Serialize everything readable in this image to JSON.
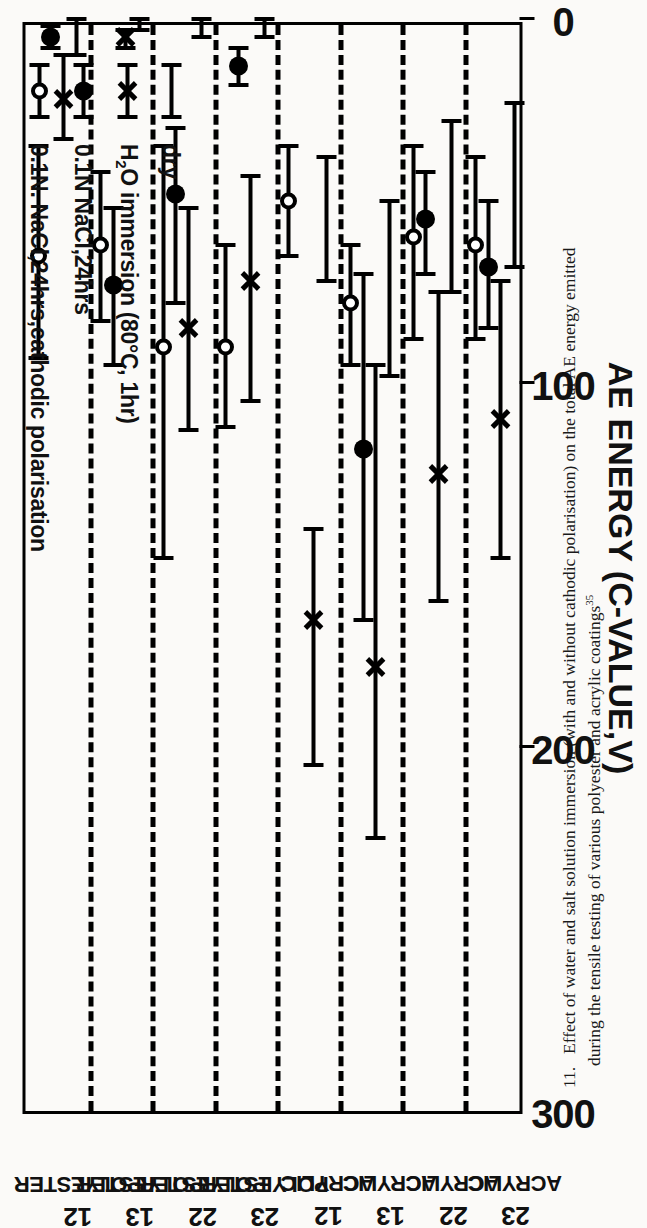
{
  "figure": {
    "caption_number": "11.",
    "caption_line1": "Effect of water and salt solution immersion (with and without cathodic polarisation) on the total AE energy emitted",
    "caption_line2": "during the tensile testing of various polyester and acrylic coatings",
    "caption_ref": "35"
  },
  "axis": {
    "title": "AE ENERGY (C-VALUE,V)",
    "ticks": [
      "0",
      "100",
      "200",
      "300"
    ],
    "min": 0,
    "max": 300
  },
  "legend": {
    "items": [
      {
        "symbol": "open-circle",
        "label": "0.1N. NaCl,24hrs,cathodic polarisation"
      },
      {
        "symbol": "filled-circle",
        "label": "0.1N NaCl,24hrs"
      },
      {
        "symbol": "cross",
        "label_pre": "H",
        "label_sub": "2",
        "label_post": "O immersion (80°C, 1hr)"
      },
      {
        "symbol": "plain-bar",
        "label": "dry"
      }
    ]
  },
  "chart_data": {
    "type": "scatter",
    "title": "",
    "xlabel": "",
    "ylabel": "AE ENERGY (C-VALUE,V)",
    "ylim": [
      0,
      300
    ],
    "grid": false,
    "legend_position": "inside-left",
    "orientation": "rotated-90-ccw",
    "categories": [
      {
        "material": "POLYESTER",
        "code": "12"
      },
      {
        "material": "POLYESTER",
        "code": "13"
      },
      {
        "material": "POLYESTER",
        "code": "22"
      },
      {
        "material": "POLYESTER",
        "code": "23"
      },
      {
        "material": "ACRYLIC",
        "code": "12"
      },
      {
        "material": "ACRYLIC",
        "code": "13"
      },
      {
        "material": "ACRYLIC",
        "code": "22"
      },
      {
        "material": "ACRYLIC",
        "code": "23"
      }
    ],
    "series": [
      {
        "name": "0.1N. NaCl,24hrs,cathodic polarisation",
        "marker": "open-circle",
        "values": [
          65,
          62,
          90,
          90,
          50,
          78,
          60,
          62
        ],
        "err_low": [
          35,
          42,
          35,
          62,
          35,
          62,
          35,
          38
        ],
        "err_high": [
          93,
          83,
          148,
          112,
          65,
          95,
          88,
          88
        ]
      },
      {
        "name": "0.1N NaCl,24hrs",
        "marker": "filled-circle",
        "values": [
          5,
          73,
          48,
          13,
          null,
          118,
          55,
          68
        ],
        "err_low": [
          2,
          52,
          30,
          8,
          null,
          70,
          42,
          50
        ],
        "err_high": [
          8,
          95,
          78,
          18,
          null,
          165,
          70,
          85
        ]
      },
      {
        "name": "H2O immersion (80°C, 1hr)",
        "marker": "cross",
        "values": [
          22,
          5,
          85,
          72,
          165,
          178,
          125,
          110
        ],
        "err_low": [
          10,
          3,
          52,
          43,
          140,
          95,
          75,
          72
        ],
        "err_high": [
          33,
          8,
          113,
          105,
          205,
          225,
          160,
          148
        ]
      },
      {
        "name": "dry",
        "marker": "plain-bar",
        "values": [
          null,
          null,
          null,
          null,
          null,
          null,
          null,
          null
        ],
        "err_low": [
          0,
          0,
          0,
          0,
          38,
          50,
          28,
          23
        ],
        "err_high": [
          10,
          3,
          5,
          5,
          72,
          98,
          75,
          68
        ]
      }
    ]
  }
}
